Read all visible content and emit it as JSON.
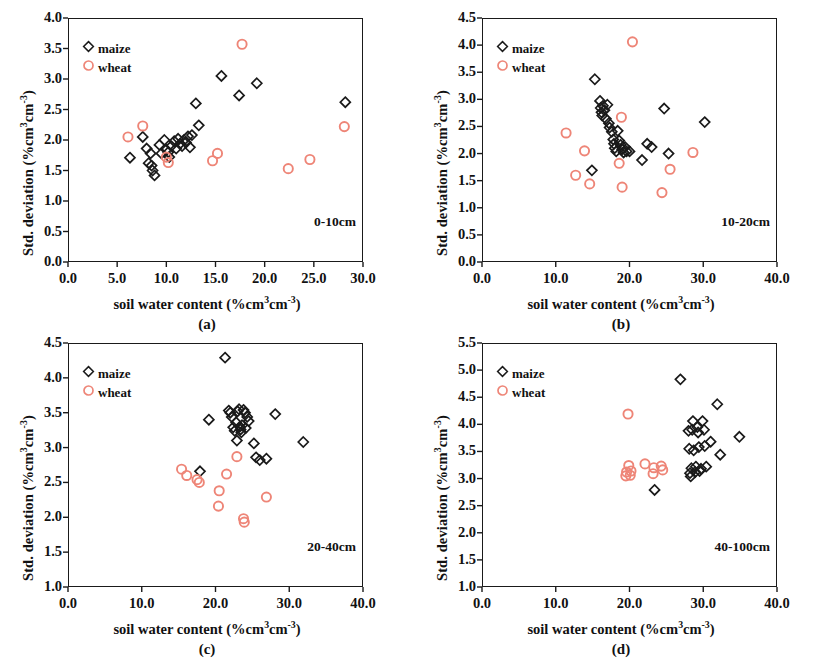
{
  "figure": {
    "background": "#ffffff",
    "maize_color": "#1a1a1a",
    "wheat_color": "#ee8577",
    "axis_color": "#1a1a1a"
  },
  "legend": {
    "maize_label": "maize",
    "wheat_label": "wheat",
    "maize_marker": "diamond-outline-icon",
    "wheat_marker": "circle-outline-icon"
  },
  "captions": {
    "a": "(a)",
    "b": "(b)",
    "c": "(c)",
    "d": "(d)"
  },
  "axis_text": {
    "xlabel_prefix": "soil water content (%cm",
    "xlabel_sup1": "3",
    "xlabel_mid": "cm",
    "xlabel_sup2": "-3",
    "xlabel_suffix": ")",
    "ylabel_prefix": "Std. deviation (%cm",
    "ylabel_sup1": "3",
    "ylabel_mid": "cm",
    "ylabel_sup2": "-3",
    "ylabel_suffix": ")"
  },
  "chart_data": [
    {
      "id": "a",
      "type": "scatter",
      "title": "",
      "annotation": "0-10cm",
      "xlabel": "soil water content (%cm3cm-3)",
      "ylabel": "Std. deviation (%cm3cm-3)",
      "xlim": [
        0.0,
        30.0
      ],
      "ylim": [
        0.0,
        4.0
      ],
      "xticks": [
        "0.0",
        "5.0",
        "10.0",
        "15.0",
        "20.0",
        "25.0",
        "30.0"
      ],
      "yticks": [
        "0.0",
        "0.5",
        "1.0",
        "1.5",
        "2.0",
        "2.5",
        "3.0",
        "3.5",
        "4.0"
      ],
      "grid": false,
      "legend_position": "top-left",
      "series": [
        {
          "name": "maize",
          "marker": "diamond",
          "color": "#1a1a1a",
          "points": [
            [
              6.3,
              1.71
            ],
            [
              7.6,
              2.05
            ],
            [
              8.0,
              1.86
            ],
            [
              8.2,
              1.62
            ],
            [
              8.4,
              1.78
            ],
            [
              8.5,
              1.58
            ],
            [
              8.6,
              1.5
            ],
            [
              8.8,
              1.42
            ],
            [
              9.3,
              1.92
            ],
            [
              9.5,
              1.78
            ],
            [
              9.8,
              2.0
            ],
            [
              10.0,
              1.84
            ],
            [
              10.2,
              1.8
            ],
            [
              10.3,
              1.72
            ],
            [
              10.5,
              1.9
            ],
            [
              10.8,
              1.98
            ],
            [
              11.0,
              1.86
            ],
            [
              11.2,
              2.02
            ],
            [
              11.4,
              1.94
            ],
            [
              11.6,
              1.9
            ],
            [
              11.8,
              2.0
            ],
            [
              12.0,
              1.96
            ],
            [
              12.2,
              2.06
            ],
            [
              12.4,
              1.88
            ],
            [
              12.6,
              2.08
            ],
            [
              13.0,
              2.6
            ],
            [
              13.3,
              2.24
            ],
            [
              15.6,
              3.05
            ],
            [
              17.4,
              2.73
            ],
            [
              19.2,
              2.93
            ],
            [
              28.2,
              2.62
            ]
          ]
        },
        {
          "name": "wheat",
          "marker": "circle",
          "color": "#ee8577",
          "points": [
            [
              6.1,
              2.05
            ],
            [
              7.6,
              2.23
            ],
            [
              10.0,
              1.72
            ],
            [
              10.2,
              1.63
            ],
            [
              14.7,
              1.66
            ],
            [
              15.2,
              1.78
            ],
            [
              17.7,
              3.57
            ],
            [
              22.4,
              1.53
            ],
            [
              24.6,
              1.68
            ],
            [
              28.1,
              2.22
            ]
          ]
        }
      ]
    },
    {
      "id": "b",
      "type": "scatter",
      "title": "",
      "annotation": "10-20cm",
      "xlabel": "soil water content (%cm3cm-3)",
      "ylabel": "Std. deviation (%cm3cm-3)",
      "xlim": [
        0.0,
        40.0
      ],
      "ylim": [
        0.0,
        4.5
      ],
      "xticks": [
        "0.0",
        "10.0",
        "20.0",
        "30.0",
        "40.0"
      ],
      "yticks": [
        "0.0",
        "0.5",
        "1.0",
        "1.5",
        "2.0",
        "2.5",
        "3.0",
        "3.5",
        "4.0",
        "4.5"
      ],
      "grid": false,
      "legend_position": "top-left",
      "series": [
        {
          "name": "maize",
          "marker": "diamond",
          "color": "#1a1a1a",
          "points": [
            [
              14.9,
              1.69
            ],
            [
              15.3,
              3.37
            ],
            [
              16.0,
              2.97
            ],
            [
              16.1,
              2.84
            ],
            [
              16.2,
              2.76
            ],
            [
              16.3,
              2.7
            ],
            [
              16.4,
              2.88
            ],
            [
              16.6,
              2.8
            ],
            [
              16.8,
              2.64
            ],
            [
              17.0,
              2.9
            ],
            [
              17.2,
              2.56
            ],
            [
              17.3,
              2.48
            ],
            [
              17.6,
              2.4
            ],
            [
              17.8,
              2.26
            ],
            [
              17.9,
              2.18
            ],
            [
              18.0,
              2.1
            ],
            [
              18.2,
              2.04
            ],
            [
              18.4,
              2.42
            ],
            [
              18.6,
              2.24
            ],
            [
              18.8,
              2.16
            ],
            [
              19.0,
              2.08
            ],
            [
              19.2,
              2.02
            ],
            [
              19.4,
              2.12
            ],
            [
              19.6,
              2.04
            ],
            [
              20.0,
              2.04
            ],
            [
              21.7,
              1.88
            ],
            [
              22.4,
              2.18
            ],
            [
              23.0,
              2.12
            ],
            [
              24.7,
              2.83
            ],
            [
              25.3,
              2.0
            ],
            [
              30.2,
              2.58
            ]
          ]
        },
        {
          "name": "wheat",
          "marker": "circle",
          "color": "#ee8577",
          "points": [
            [
              11.4,
              2.38
            ],
            [
              12.7,
              1.6
            ],
            [
              13.9,
              2.05
            ],
            [
              14.6,
              1.44
            ],
            [
              18.6,
              1.82
            ],
            [
              18.9,
              2.67
            ],
            [
              19.0,
              1.38
            ],
            [
              20.4,
              4.06
            ],
            [
              24.4,
              1.28
            ],
            [
              25.5,
              1.71
            ],
            [
              28.6,
              2.02
            ]
          ]
        }
      ]
    },
    {
      "id": "c",
      "type": "scatter",
      "title": "",
      "annotation": "20-40cm",
      "xlabel": "soil water content (%cm3cm-3)",
      "ylabel": "Std. deviation (%cm3cm-3)",
      "xlim": [
        0.0,
        40.0
      ],
      "ylim": [
        1.0,
        4.5
      ],
      "xticks": [
        "0.0",
        "10.0",
        "20.0",
        "30.0",
        "40.0"
      ],
      "yticks": [
        "1.0",
        "1.5",
        "2.0",
        "2.5",
        "3.0",
        "3.5",
        "4.0",
        "4.5"
      ],
      "grid": false,
      "legend_position": "top-left",
      "series": [
        {
          "name": "maize",
          "marker": "diamond",
          "color": "#1a1a1a",
          "points": [
            [
              17.9,
              2.66
            ],
            [
              19.1,
              3.4
            ],
            [
              21.3,
              4.29
            ],
            [
              21.8,
              3.53
            ],
            [
              22.0,
              3.5
            ],
            [
              22.2,
              3.44
            ],
            [
              22.4,
              3.29
            ],
            [
              22.6,
              3.24
            ],
            [
              22.8,
              3.36
            ],
            [
              22.9,
              3.1
            ],
            [
              23.0,
              3.52
            ],
            [
              23.2,
              3.55
            ],
            [
              23.3,
              3.3
            ],
            [
              23.4,
              3.26
            ],
            [
              23.5,
              3.22
            ],
            [
              23.6,
              3.32
            ],
            [
              23.8,
              3.54
            ],
            [
              24.0,
              3.5
            ],
            [
              24.1,
              3.28
            ],
            [
              24.3,
              3.44
            ],
            [
              24.5,
              3.38
            ],
            [
              25.2,
              3.06
            ],
            [
              25.5,
              2.86
            ],
            [
              26.0,
              2.82
            ],
            [
              26.9,
              2.84
            ],
            [
              28.1,
              3.48
            ],
            [
              31.9,
              3.08
            ]
          ]
        },
        {
          "name": "wheat",
          "marker": "circle",
          "color": "#ee8577",
          "points": [
            [
              15.4,
              2.69
            ],
            [
              16.1,
              2.6
            ],
            [
              17.5,
              2.54
            ],
            [
              17.8,
              2.5
            ],
            [
              20.5,
              2.38
            ],
            [
              20.4,
              2.16
            ],
            [
              21.5,
              2.62
            ],
            [
              22.9,
              2.87
            ],
            [
              23.8,
              1.98
            ],
            [
              23.9,
              1.93
            ],
            [
              26.9,
              2.29
            ]
          ]
        }
      ]
    },
    {
      "id": "d",
      "type": "scatter",
      "title": "",
      "annotation": "40-100cm",
      "xlabel": "soil water content (%cm3cm-3)",
      "ylabel": "Std. deviation (%cm3cm-3)",
      "xlim": [
        0.0,
        40.0
      ],
      "ylim": [
        1.0,
        5.5
      ],
      "xticks": [
        "0.0",
        "10.0",
        "20.0",
        "30.0",
        "40.0"
      ],
      "yticks": [
        "1.0",
        "1.5",
        "2.0",
        "2.5",
        "3.0",
        "3.5",
        "4.0",
        "4.5",
        "5.0",
        "5.5"
      ],
      "grid": false,
      "legend_position": "top-left",
      "series": [
        {
          "name": "maize",
          "marker": "diamond",
          "color": "#1a1a1a",
          "points": [
            [
              23.4,
              2.79
            ],
            [
              26.9,
              4.83
            ],
            [
              28.0,
              3.88
            ],
            [
              28.1,
              3.55
            ],
            [
              28.2,
              3.1
            ],
            [
              28.3,
              3.04
            ],
            [
              28.4,
              3.19
            ],
            [
              28.5,
              3.9
            ],
            [
              28.6,
              4.06
            ],
            [
              28.7,
              3.52
            ],
            [
              28.9,
              3.12
            ],
            [
              29.0,
              3.22
            ],
            [
              29.2,
              3.95
            ],
            [
              29.3,
              3.85
            ],
            [
              29.4,
              3.58
            ],
            [
              29.5,
              3.14
            ],
            [
              29.7,
              3.18
            ],
            [
              29.9,
              4.06
            ],
            [
              30.1,
              3.9
            ],
            [
              30.2,
              3.6
            ],
            [
              30.4,
              3.22
            ],
            [
              31.0,
              3.68
            ],
            [
              31.9,
              4.37
            ],
            [
              32.3,
              3.44
            ],
            [
              34.9,
              3.77
            ]
          ]
        },
        {
          "name": "wheat",
          "marker": "circle",
          "color": "#ee8577",
          "points": [
            [
              19.5,
              3.05
            ],
            [
              19.6,
              3.12
            ],
            [
              19.8,
              4.19
            ],
            [
              19.9,
              3.24
            ],
            [
              20.1,
              3.06
            ],
            [
              20.2,
              3.14
            ],
            [
              22.1,
              3.27
            ],
            [
              23.2,
              3.09
            ],
            [
              23.3,
              3.2
            ],
            [
              24.3,
              3.23
            ],
            [
              24.5,
              3.16
            ]
          ]
        }
      ]
    }
  ]
}
